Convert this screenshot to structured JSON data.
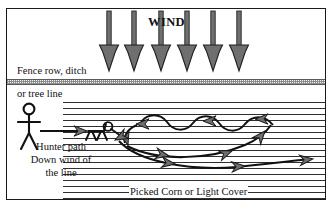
{
  "diagram": {
    "labels": {
      "wind": "WIND",
      "fence_row": "Fence row, ditch",
      "tree_line": "or tree line",
      "hunter_path_line1": "Hunter path",
      "hunter_path_line2": "Down wind of",
      "hunter_path_line3": "the line",
      "cover": "Picked Corn or Light Cover"
    },
    "icons": {
      "hunter": "stick-figure-hunter-icon",
      "dog": "stick-figure-dog-icon",
      "wind_arrow": "down-arrow-icon",
      "hunter_path_arrow": "right-arrow-icon",
      "dog_loop": "dog-search-loop-icon"
    },
    "colors": {
      "ink": "#111111",
      "arrow_fill": "#6f6f6f",
      "arrow_stroke": "#1a1a1a",
      "fence_hatch": "#8e8e8e",
      "field_dots": "#1e1e1e",
      "background": "#ffffff",
      "border": "#1a1a1a"
    },
    "wind_arrows": {
      "count": 6,
      "direction": "down",
      "x_positions": [
        108,
        133,
        160,
        186,
        212,
        238
      ],
      "shaft_top": 2,
      "head_bottom": 62
    },
    "regions": [
      {
        "name": "open-field-upwind",
        "description": "blank area above fence row where wind originates"
      },
      {
        "name": "fence-row-band",
        "description": "hatched horizontal band representing fence row, ditch or tree line"
      },
      {
        "name": "picked-corn-field",
        "description": "dotted stipple area representing picked corn or light cover"
      }
    ]
  }
}
